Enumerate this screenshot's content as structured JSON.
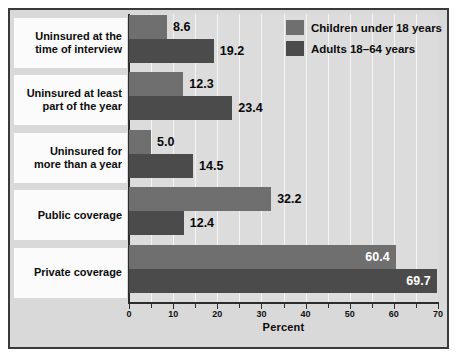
{
  "chart_data": {
    "type": "bar",
    "orientation": "horizontal",
    "title": "",
    "xlabel": "Percent",
    "ylabel": "",
    "xlim": [
      0,
      70
    ],
    "xticks": [
      0,
      10,
      20,
      30,
      40,
      50,
      60,
      70
    ],
    "xtick_labels": [
      "0",
      "10",
      "20",
      "30",
      "40",
      "50",
      "60",
      "70"
    ],
    "minor_tick_step": 5,
    "grid": "vertical-only",
    "legend_position": "top-right",
    "categories": [
      "Uninsured at the time of interview",
      "Uninsured at least part of the year",
      "Uninsured for more than a year",
      "Public coverage",
      "Private coverage"
    ],
    "category_lines": [
      [
        "Uninsured at the",
        "time of interview"
      ],
      [
        "Uninsured at least",
        "part of the year"
      ],
      [
        "Uninsured for",
        "more than a year"
      ],
      [
        "Public coverage"
      ],
      [
        "Private coverage"
      ]
    ],
    "series": [
      {
        "name": "Children under 18 years",
        "color": "#6f6f6f",
        "values": [
          8.6,
          12.3,
          5.0,
          32.2,
          60.4
        ],
        "value_labels": [
          "8.6",
          "12.3",
          "5.0",
          "32.2",
          "60.4"
        ],
        "label_placement": [
          "outside",
          "outside",
          "outside",
          "outside",
          "inside"
        ]
      },
      {
        "name": "Adults 18–64 years",
        "color": "#4b4b4b",
        "values": [
          19.2,
          23.4,
          14.5,
          12.4,
          69.7
        ],
        "value_labels": [
          "19.2",
          "23.4",
          "14.5",
          "12.4",
          "69.7"
        ],
        "label_placement": [
          "outside",
          "outside",
          "outside",
          "outside",
          "inside"
        ]
      }
    ]
  },
  "legend": {
    "items": [
      {
        "label": "Children under 18 years",
        "swatch": "children"
      },
      {
        "label": "Adults 18–64 years",
        "swatch": "adults"
      }
    ]
  },
  "axis": {
    "x_title": "Percent"
  },
  "colors": {
    "children_bar": "#6f6f6f",
    "adults_bar": "#4b4b4b",
    "plot_background": "#dcdcdc",
    "figure_background": "#d9d9d9",
    "frame_border": "#3a3a3a",
    "gridline": "#f4f4f4",
    "label_panel": "#fbfbfb"
  }
}
